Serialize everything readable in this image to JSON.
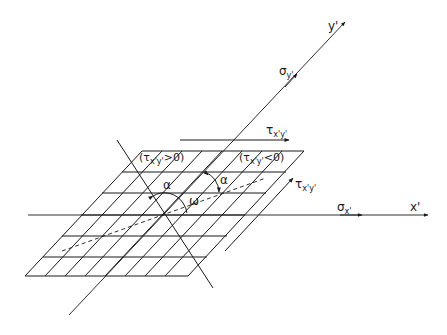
{
  "diagram": {
    "axes": {
      "x_label": "x'",
      "y_label": "y'"
    },
    "stresses": {
      "sigma_x": {
        "symbol": "σ",
        "sub": "x'"
      },
      "sigma_y": {
        "symbol": "σ",
        "sub": "y'"
      },
      "tau_top": {
        "symbol": "τ",
        "sub": "x'y'"
      },
      "tau_right": {
        "symbol": "τ",
        "sub": "x'y'"
      }
    },
    "regions": {
      "positive": {
        "open": "(",
        "symbol": "τ",
        "sub": "x'y'",
        "rel": ">0)"
      },
      "negative": {
        "open": "(",
        "symbol": "τ",
        "sub": "x'y'",
        "rel": "<0)"
      }
    },
    "angles": {
      "alpha_left": "α",
      "alpha_right": "α",
      "omega": "ω"
    },
    "grid": {
      "rows": 6,
      "cols": 8
    },
    "colors": {
      "ink": "#1a1a1a",
      "background": "#ffffff"
    }
  }
}
